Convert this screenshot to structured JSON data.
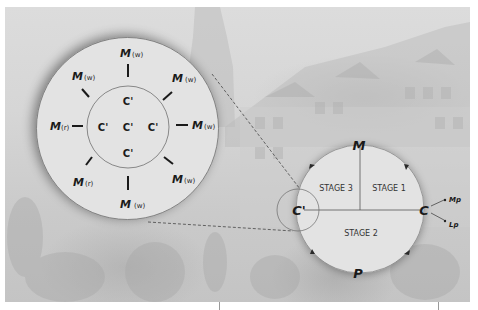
{
  "diagram": {
    "colors": {
      "circle_fill": "#e2e2e2",
      "circle_stroke": "#6a6a6a",
      "text": "#1a1a1a",
      "dashed_line": "#555555",
      "background": "#d4d4d4"
    },
    "zoom_circle": {
      "outer_labels": [
        {
          "id": "top",
          "main": "M",
          "sub": "(w)"
        },
        {
          "id": "top-right",
          "main": "M",
          "sub": "(w)"
        },
        {
          "id": "right",
          "main": "M",
          "sub": "(w)"
        },
        {
          "id": "bottom-right",
          "main": "M",
          "sub": "(w)"
        },
        {
          "id": "bottom",
          "main": "M",
          "sub": "(w)"
        },
        {
          "id": "bottom-left",
          "main": "M",
          "sub": "(r)"
        },
        {
          "id": "left",
          "main": "M",
          "sub": "(r)"
        },
        {
          "id": "top-left",
          "main": "M",
          "sub": "(w)"
        }
      ],
      "inner_labels": [
        {
          "id": "top",
          "text": "C'"
        },
        {
          "id": "left",
          "text": "C'"
        },
        {
          "id": "center",
          "text": "C'"
        },
        {
          "id": "right",
          "text": "C'"
        },
        {
          "id": "bottom",
          "text": "C'"
        }
      ]
    },
    "circuit_circle": {
      "top_label": "M",
      "bottom_label": "P",
      "left_label": "C'",
      "right_label": "C",
      "stages": [
        {
          "id": "stage-3",
          "text": "STAGE 3"
        },
        {
          "id": "stage-1",
          "text": "STAGE 1"
        },
        {
          "id": "stage-2",
          "text": "STAGE 2"
        }
      ],
      "branches": [
        {
          "id": "mp",
          "text": "Mp"
        },
        {
          "id": "lp",
          "text": "Lp"
        }
      ],
      "flow_direction": "clockwise"
    }
  }
}
